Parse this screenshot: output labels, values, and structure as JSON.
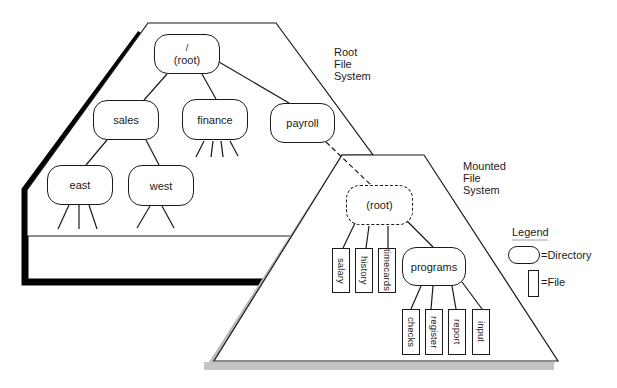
{
  "root_fs": {
    "title_lines": [
      "Root",
      "File",
      "System"
    ],
    "root_node": {
      "line1": "/",
      "line2": "(root)"
    },
    "directories": [
      {
        "id": "sales",
        "label": "sales"
      },
      {
        "id": "finance",
        "label": "finance"
      },
      {
        "id": "payroll",
        "label": "payroll"
      },
      {
        "id": "east",
        "label": "east"
      },
      {
        "id": "west",
        "label": "west"
      }
    ]
  },
  "mounted_fs": {
    "title_lines": [
      "Mounted",
      "File",
      "System"
    ],
    "root_node": {
      "label": "(root)"
    },
    "files": [
      {
        "id": "salary",
        "label": "salary"
      },
      {
        "id": "history",
        "label": "history"
      },
      {
        "id": "timecards",
        "label": "timecards"
      }
    ],
    "directories": [
      {
        "id": "programs",
        "label": "programs"
      }
    ],
    "program_files": [
      {
        "id": "checks",
        "label": "checks"
      },
      {
        "id": "register",
        "label": "register"
      },
      {
        "id": "report",
        "label": "report"
      },
      {
        "id": "input",
        "label": "input"
      }
    ]
  },
  "legend": {
    "title": "Legend",
    "directory_label": "=Directory",
    "file_label": "=File"
  },
  "colors": {
    "line": "#1a1a1a",
    "shadow_root": "#000000",
    "shadow_mounted": "#b8b8b8",
    "background": "#ffffff"
  }
}
